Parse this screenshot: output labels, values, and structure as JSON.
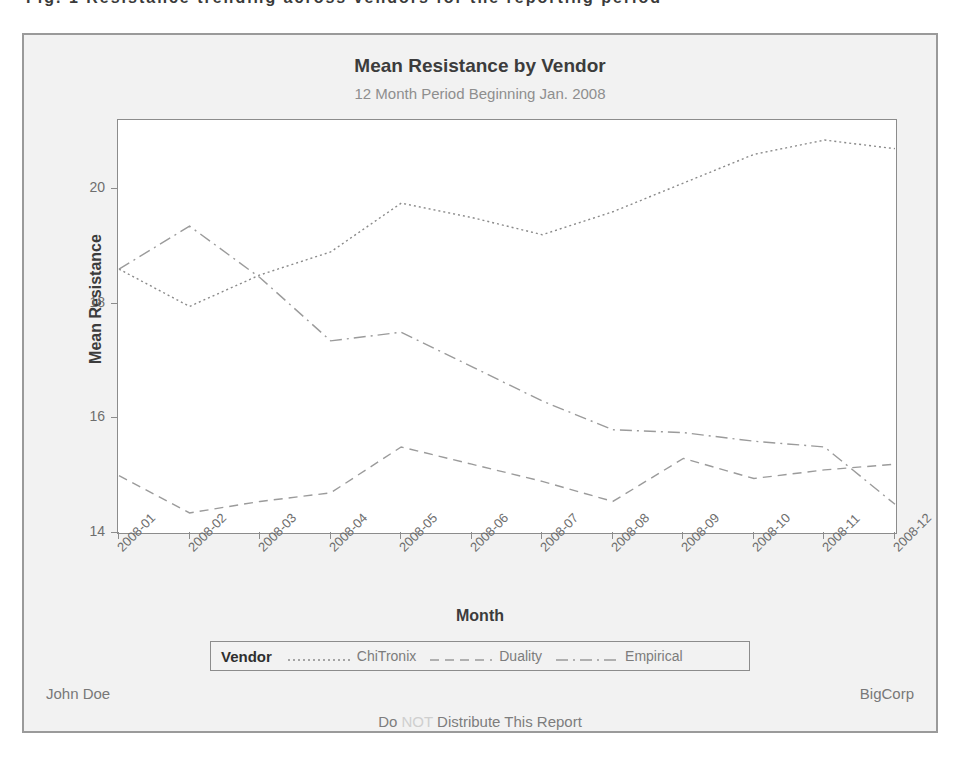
{
  "top_clipped_text": "Fig. 1   Resistance trending across vendors for the reporting period",
  "chart": {
    "title": "Mean Resistance by Vendor",
    "subtitle": "12 Month Period Beginning Jan. 2008",
    "legend_title": "Vendor"
  },
  "footer": {
    "left": "John Doe",
    "right": "BigCorp",
    "center_prefix": "Do",
    "center_emphasis": "NOT",
    "center_suffix": "Distribute This Report"
  },
  "colors": {
    "frame": "#9a9a9a",
    "figure_background": "#f2f2f2",
    "plot_background": "#ffffff",
    "title_text": "#3c3c3c",
    "subtitle_text": "#8e8e8e",
    "tick_text": "#6e6e6e",
    "series_chitronix": "#8a8a8a",
    "series_duality": "#9b9b9b",
    "series_empirical": "#9b9b9b",
    "emphasis_text": "#cfcfcf"
  },
  "chart_data": {
    "type": "line",
    "title": "Mean Resistance by Vendor",
    "subtitle": "12 Month Period Beginning Jan. 2008",
    "xlabel": "Month",
    "ylabel": "Mean Resistance",
    "ylim": [
      14,
      21.2
    ],
    "yticks": [
      14,
      16,
      18,
      20
    ],
    "grid": false,
    "legend_position": "bottom",
    "legend_title": "Vendor",
    "categories": [
      "2008-01",
      "2008-02",
      "2008-03",
      "2008-04",
      "2008-05",
      "2008-06",
      "2008-07",
      "2008-08",
      "2008-09",
      "2008-10",
      "2008-11",
      "2008-12"
    ],
    "series": [
      {
        "name": "ChiTronix",
        "linestyle": "dotted",
        "values": [
          18.6,
          17.95,
          18.5,
          18.9,
          19.75,
          19.5,
          19.2,
          19.6,
          20.1,
          20.6,
          20.85,
          20.7
        ]
      },
      {
        "name": "Duality",
        "linestyle": "dashed",
        "values": [
          15.0,
          14.35,
          14.55,
          14.7,
          15.5,
          15.2,
          14.9,
          14.55,
          15.3,
          14.95,
          15.1,
          15.2
        ]
      },
      {
        "name": "Empirical",
        "linestyle": "dashdot",
        "values": [
          18.6,
          19.35,
          18.45,
          17.35,
          17.5,
          16.9,
          16.3,
          15.8,
          15.75,
          15.6,
          15.5,
          14.5
        ]
      }
    ]
  }
}
